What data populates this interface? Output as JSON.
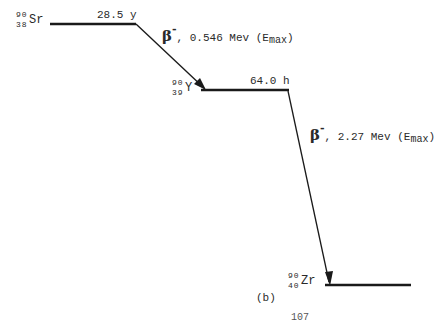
{
  "diagram": {
    "type": "decay-scheme",
    "line_color": "#1a1a1a",
    "levels": [
      {
        "nuclide": {
          "mass": "90",
          "atomic": "38",
          "symbol": "Sr"
        },
        "half_life": "28.5 y"
      },
      {
        "nuclide": {
          "mass": "90",
          "atomic": "39",
          "symbol": "Y"
        },
        "half_life": "64.0 h"
      },
      {
        "nuclide": {
          "mass": "90",
          "atomic": "40",
          "symbol": "Zr"
        },
        "half_life": ""
      }
    ],
    "transitions": [
      {
        "particle": "β",
        "charge": "-",
        "energy_text": ", 0.546 Mev (E",
        "subscript": "max",
        "close": ")"
      },
      {
        "particle": "β",
        "charge": "-",
        "energy_text": ", 2.27 Mev (E",
        "subscript": "max",
        "close": ")"
      }
    ],
    "caption": "(b)",
    "page_number_partial": "107"
  }
}
